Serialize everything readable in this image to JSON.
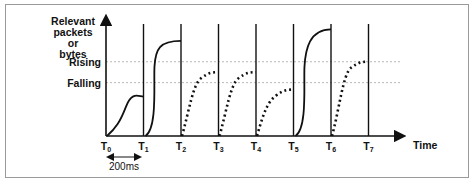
{
  "diagram": {
    "y_axis_label": [
      "Relevant",
      "packets",
      "or",
      "bytes"
    ],
    "x_axis_label": "Time",
    "thresholds": [
      {
        "name": "rising",
        "label": "Rising",
        "level": 0.64
      },
      {
        "name": "falling",
        "label": "Falling",
        "level": 0.46
      }
    ],
    "ticks": [
      {
        "base": "T",
        "sub": "0"
      },
      {
        "base": "T",
        "sub": "1"
      },
      {
        "base": "T",
        "sub": "2"
      },
      {
        "base": "T",
        "sub": "3"
      },
      {
        "base": "T",
        "sub": "4"
      },
      {
        "base": "T",
        "sub": "5"
      },
      {
        "base": "T",
        "sub": "6"
      },
      {
        "base": "T",
        "sub": "7"
      }
    ],
    "interval_label": "200ms",
    "intervals": [
      {
        "style": "solid",
        "end_level": 0.34
      },
      {
        "style": "solid",
        "end_level": 0.82
      },
      {
        "style": "dotted",
        "end_level": 0.55
      },
      {
        "style": "dotted",
        "end_level": 0.55
      },
      {
        "style": "dotted",
        "end_level": 0.4
      },
      {
        "style": "solid",
        "end_level": 0.92
      },
      {
        "style": "dotted",
        "end_level": 0.64
      }
    ],
    "colors": {
      "line": "#111111",
      "threshold": "#b0b0b0",
      "frame": "#9a9a9a"
    }
  }
}
